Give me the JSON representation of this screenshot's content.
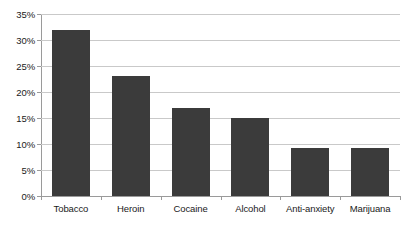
{
  "chart_data": {
    "type": "bar",
    "title": "",
    "subtitle": "",
    "xlabel": "",
    "ylabel": "",
    "categories": [
      "Tobacco",
      "Heroin",
      "Cocaine",
      "Alcohol",
      "Anti-anxiety",
      "Marijuana"
    ],
    "values": [
      32,
      23,
      17,
      15,
      9.2,
      9.2
    ],
    "value_labels": [
      "32%",
      "23%",
      "17%",
      "15%",
      "9.2%",
      "9.2%"
    ],
    "ylim": [
      0,
      35
    ],
    "ytick_values": [
      0,
      5,
      10,
      15,
      20,
      25,
      30,
      35
    ],
    "ytick_labels": [
      "0%",
      "5%",
      "10%",
      "15%",
      "20%",
      "25%",
      "30%",
      "35%"
    ],
    "grid": true,
    "grid_axis": "y",
    "legend": false,
    "legend_position": "none",
    "series": [
      {
        "name": "",
        "values": [
          32,
          23,
          17,
          15,
          9.2,
          9.2
        ]
      }
    ],
    "colors": {
      "bar_fill": "#3b3b3b",
      "gridline": "#c9c9c9",
      "axis_line": "#9a9a9a",
      "tick_label": "#1a1a1a",
      "background": "#ffffff"
    }
  }
}
